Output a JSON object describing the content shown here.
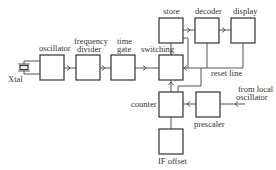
{
  "diagram": {
    "type": "block-diagram",
    "blocks": {
      "xtal": {
        "label": "Xtal"
      },
      "oscillator": {
        "label": "oscillator"
      },
      "frequency_divider": {
        "label_line1": "frequency",
        "label_line2": "divider"
      },
      "time_gate": {
        "label_line1": "time",
        "label_line2": "gate"
      },
      "switching": {
        "label": "switching"
      },
      "store": {
        "label": "store"
      },
      "decoder": {
        "label": "decoder"
      },
      "display": {
        "label": "display"
      },
      "counter": {
        "label": "counter"
      },
      "prescaler": {
        "label": "prescaler"
      },
      "if_offset": {
        "label": "IF offset"
      }
    },
    "annotations": {
      "reset_line": "reset line",
      "from_local_line1": "from local",
      "from_local_line2": "oscillator"
    },
    "connections": [
      [
        "xtal",
        "oscillator"
      ],
      [
        "oscillator",
        "frequency_divider"
      ],
      [
        "frequency_divider",
        "time_gate"
      ],
      [
        "time_gate",
        "switching"
      ],
      [
        "switching",
        "store"
      ],
      [
        "store",
        "decoder"
      ],
      [
        "decoder",
        "display"
      ],
      [
        "store",
        "switching"
      ],
      [
        "decoder",
        "reset line"
      ],
      [
        "display",
        "reset line"
      ],
      [
        "reset line",
        "counter"
      ],
      [
        "counter",
        "switching"
      ],
      [
        "prescaler",
        "counter"
      ],
      [
        "local oscillator",
        "prescaler"
      ],
      [
        "if_offset",
        "counter"
      ]
    ]
  }
}
